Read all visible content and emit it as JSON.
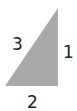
{
  "figure": {
    "type": "right-triangle",
    "fill_color": "#a9a9a9",
    "labels": {
      "hypotenuse": "3",
      "vertical_side": "1",
      "base": "2"
    }
  }
}
